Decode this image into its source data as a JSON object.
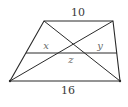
{
  "diagram": {
    "type": "trapezoid-with-diagonals-and-midline",
    "stroke_color": "#2a2a2a",
    "vertices": {
      "top_left": [
        44,
        21
      ],
      "top_right": [
        113,
        21
      ],
      "bottom_right": [
        120,
        81
      ],
      "bottom_left": [
        10,
        81
      ]
    },
    "midline": {
      "y": 53,
      "x_start": 26,
      "x_end": 117
    },
    "labels": {
      "top_base": "10",
      "bottom_base": "16",
      "left_segment": "x",
      "right_segment": "y",
      "middle_segment": "z"
    }
  }
}
